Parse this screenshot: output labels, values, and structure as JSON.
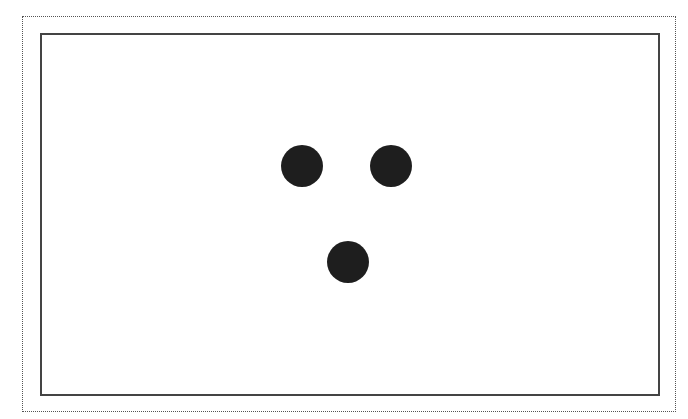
{
  "canvas": {
    "outer_border": {
      "x": 22,
      "y": 16,
      "width": 654,
      "height": 396,
      "style": "dotted",
      "color": "#555555"
    },
    "inner_frame": {
      "x": 40,
      "y": 33,
      "width": 620,
      "height": 363,
      "color": "#444444"
    },
    "dots": [
      {
        "cx": 302,
        "cy": 166,
        "r": 21,
        "color": "#1e1e1e"
      },
      {
        "cx": 391,
        "cy": 166,
        "r": 21,
        "color": "#1e1e1e"
      },
      {
        "cx": 348,
        "cy": 262,
        "r": 21,
        "color": "#1e1e1e"
      }
    ]
  }
}
